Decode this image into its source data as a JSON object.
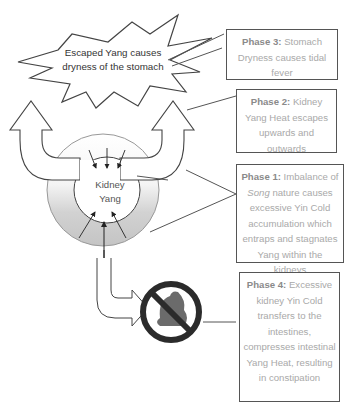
{
  "burst": {
    "line1": "Escaped Yang causes",
    "line2": "dryness of the stomach"
  },
  "center": {
    "line1": "Kidney",
    "line2": "Yang"
  },
  "phases": [
    {
      "id": "phase3",
      "label": "Phase 3:",
      "text": "Stomach Dryness causes tidal fever"
    },
    {
      "id": "phase2",
      "label": "Phase 2:",
      "text": "Kidney Yang Heat escapes upwards and outwards"
    },
    {
      "id": "phase1",
      "label": "Phase 1:",
      "text_before": "Imbalance of",
      "emphasis": "Song",
      "text_after": "nature causes excessive Yin Cold accumulation which entraps and stagnates Yang within the kidneys"
    },
    {
      "id": "phase4",
      "label": "Phase 4:",
      "text": "Excessive kidney Yin Cold transfers to the intestines, compresses intestinal Yang Heat, resulting in constipation"
    }
  ],
  "icons": {
    "no_stool": "prohibited-stool-icon"
  },
  "colors": {
    "outline": "#555555",
    "phase_text": "#a9a9a9",
    "phase_label": "#8a8a8a",
    "ring_gray": "#cfcfcf",
    "prohibit": "#2b2b2b",
    "stool": "#6b6b6b"
  }
}
